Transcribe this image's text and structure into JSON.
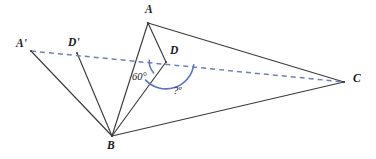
{
  "figure": {
    "background_color": "#ffffff",
    "width": 376,
    "height": 159
  },
  "style": {
    "solid_line_color": "#3b3b3b",
    "dashed_line_color": "#6f7fbe",
    "arc_color": "#5a73c4",
    "label_color": "#1b1b1b",
    "angle_label_color": "#17171c"
  },
  "points": {
    "A": {
      "label": "A",
      "x": 148,
      "y": 23,
      "label_x": 145,
      "label_y": 4
    },
    "B": {
      "label": "B",
      "x": 112,
      "y": 136,
      "label_x": 107,
      "label_y": 140
    },
    "C": {
      "label": "C",
      "x": 344,
      "y": 82,
      "label_x": 353,
      "label_y": 73
    },
    "D": {
      "label": "D",
      "x": 166,
      "y": 62,
      "label_x": 170,
      "label_y": 45
    },
    "Ap": {
      "label": "A'",
      "x": 31,
      "y": 51,
      "label_x": 16,
      "label_y": 38
    },
    "Dp": {
      "label": "D'",
      "x": 77,
      "y": 53,
      "label_x": 68,
      "label_y": 37
    }
  },
  "segments": [
    {
      "name": "segment-AB",
      "from": "A",
      "to": "B",
      "style": "solid"
    },
    {
      "name": "segment-AD",
      "from": "A",
      "to": "D",
      "style": "solid"
    },
    {
      "name": "segment-AC",
      "from": "A",
      "to": "C",
      "style": "solid"
    },
    {
      "name": "segment-BC",
      "from": "B",
      "to": "C",
      "style": "solid"
    },
    {
      "name": "segment-BD",
      "from": "B",
      "to": "D",
      "style": "solid"
    },
    {
      "name": "segment-BA-prime",
      "from": "B",
      "to": "Ap",
      "style": "solid"
    },
    {
      "name": "segment-BD-prime",
      "from": "B",
      "to": "Dp",
      "style": "solid"
    },
    {
      "name": "segment-A-prime-C-dashed",
      "from": "Ap",
      "to": "C",
      "style": "dashed"
    }
  ],
  "angles": [
    {
      "name": "angle-60",
      "vertex": "D",
      "value_text": "60°",
      "label_x": 132,
      "label_y": 72,
      "radius": 17
    },
    {
      "name": "angle-unknown",
      "vertex": "D",
      "value_text": "?º",
      "label_x": 173,
      "label_y": 86,
      "radius": 28
    }
  ]
}
